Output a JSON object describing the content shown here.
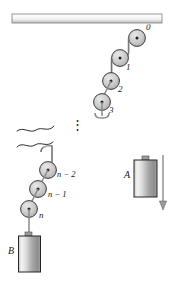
{
  "figure": {
    "colors": {
      "ink": "#1a1a1a",
      "rope": "#8a8a8a",
      "ceiling_light": "#ffffff",
      "ceiling_dark": "#b9b9b9",
      "pulley_fill": "#c9c9c9",
      "block_light": "#f2f2f2",
      "block_dark": "#8d8d8d",
      "background": "#ffffff"
    },
    "pulleys": [
      {
        "id": "pulley-0",
        "label": "0"
      },
      {
        "id": "pulley-1",
        "label": "1"
      },
      {
        "id": "pulley-2",
        "label": "2"
      },
      {
        "id": "pulley-3",
        "label": "3"
      },
      {
        "id": "pulley-n-minus-2",
        "label": "n − 2"
      },
      {
        "id": "pulley-n-minus-1",
        "label": "n − 1"
      },
      {
        "id": "pulley-n",
        "label": "n"
      }
    ],
    "blocks": [
      {
        "id": "block-a",
        "label": "A"
      },
      {
        "id": "block-b",
        "label": "B"
      }
    ],
    "annotations": {
      "ellipsis": "⋮",
      "velocity_arrow": "downward",
      "break_marks": 2
    }
  }
}
